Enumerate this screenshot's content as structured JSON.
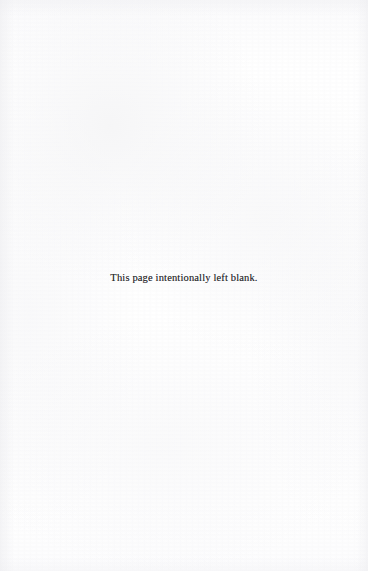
{
  "document": {
    "page_type": "intentionally-blank-page",
    "notice_text": "This page intentionally left blank.",
    "background_color": "#fefefe",
    "text_color": "#2b2b2d",
    "header_text": "",
    "footer_text": "",
    "page_number": ""
  }
}
